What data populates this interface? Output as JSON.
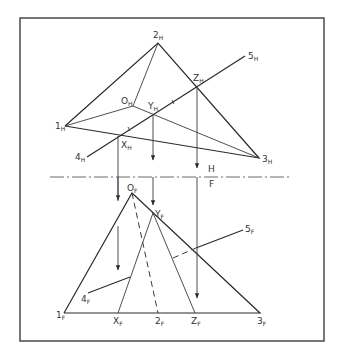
{
  "diagram": {
    "title": "",
    "frame": {
      "x": 20,
      "y": 18,
      "w": 304,
      "h": 323,
      "color": "#555555"
    },
    "fold_line": {
      "y": 177,
      "x1": 50,
      "x2": 292,
      "label_top": "H",
      "label_bottom": "F"
    },
    "top_view": {
      "points": [
        {
          "id": "2",
          "sub": "H",
          "x": 158,
          "y": 43
        },
        {
          "id": "1",
          "sub": "H",
          "x": 65,
          "y": 126
        },
        {
          "id": "3",
          "sub": "H",
          "x": 259,
          "y": 158
        },
        {
          "id": "O",
          "sub": "H",
          "x": 133,
          "y": 106
        },
        {
          "id": "Y",
          "sub": "H",
          "x": 153,
          "y": 115
        },
        {
          "id": "Z",
          "sub": "H",
          "x": 197,
          "y": 88
        },
        {
          "id": "X",
          "sub": "H",
          "x": 118,
          "y": 136
        },
        {
          "id": "4",
          "sub": "H",
          "x": 87,
          "y": 157
        },
        {
          "id": "5",
          "sub": "H",
          "x": 245,
          "y": 56
        }
      ]
    },
    "front_view": {
      "points": [
        {
          "id": "O",
          "sub": "F",
          "x": 132,
          "y": 193
        },
        {
          "id": "Y",
          "sub": "F",
          "x": 153,
          "y": 213
        },
        {
          "id": "1",
          "sub": "F",
          "x": 64,
          "y": 313
        },
        {
          "id": "X",
          "sub": "F",
          "x": 118,
          "y": 313
        },
        {
          "id": "2",
          "sub": "F",
          "x": 158,
          "y": 313
        },
        {
          "id": "Z",
          "sub": "F",
          "x": 195,
          "y": 313
        },
        {
          "id": "3",
          "sub": "F",
          "x": 260,
          "y": 313
        },
        {
          "id": "4",
          "sub": "F",
          "x": 88,
          "y": 293
        },
        {
          "id": "5",
          "sub": "F",
          "x": 243,
          "y": 230
        }
      ]
    },
    "labels": {
      "l2H": "2",
      "l1H": "1",
      "l3H": "3",
      "lOH": "O",
      "lYH": "Y",
      "lZH": "Z",
      "lXH": "X",
      "l4H": "4",
      "l5H": "5",
      "lOF": "O",
      "lYF": "Y",
      "l1F": "1",
      "lXF": "X",
      "l2F": "2",
      "lZF": "Z",
      "l3F": "3",
      "l4F": "4",
      "l5F": "5",
      "subH": "H",
      "subF": "F"
    }
  }
}
